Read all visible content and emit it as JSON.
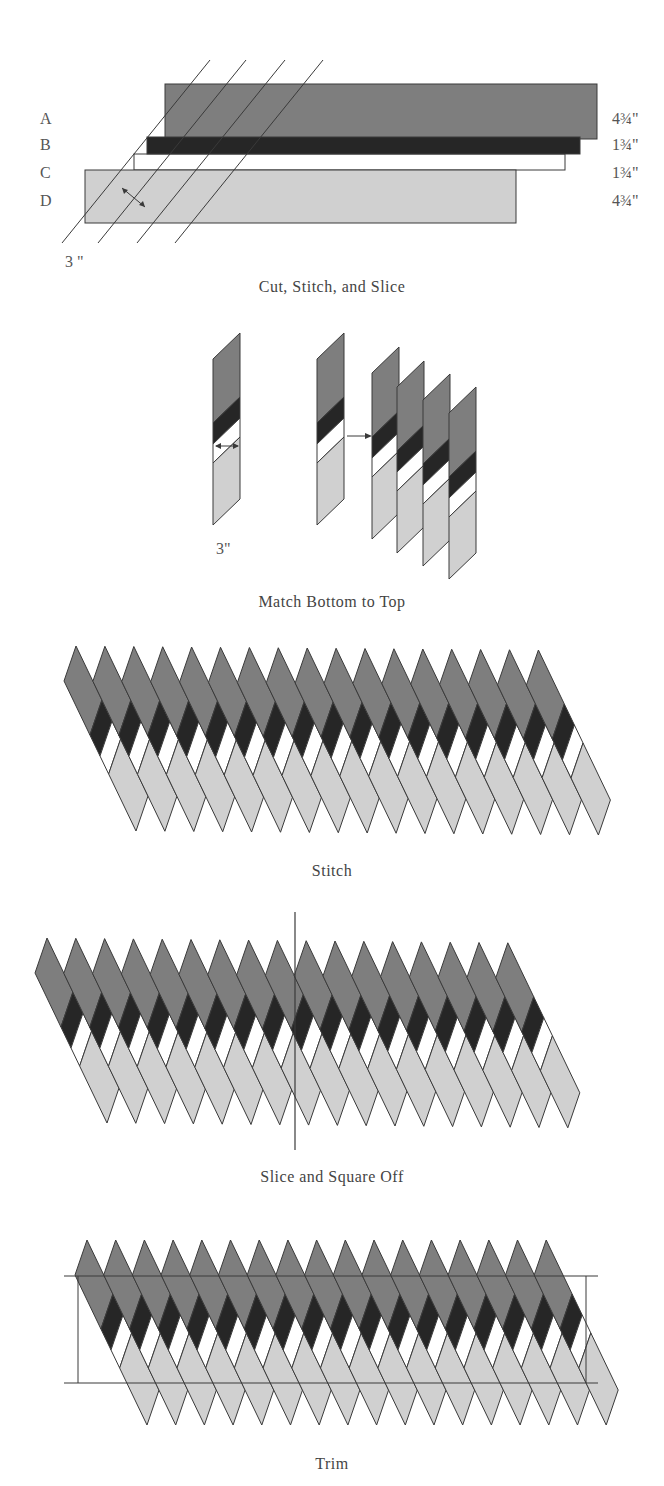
{
  "colors": {
    "dark": "#7e7e7e",
    "black": "#262626",
    "white": "#ffffff",
    "light": "#d0d0d0",
    "line": "#3a3a3a"
  },
  "step1": {
    "caption": "Cut, Stitch, and Slice",
    "strips": [
      {
        "label": "A",
        "width": "4¾\""
      },
      {
        "label": "B",
        "width": "1¾\""
      },
      {
        "label": "C",
        "width": "1¾\""
      },
      {
        "label": "D",
        "width": "4¾\""
      }
    ],
    "slice_width": "3 \""
  },
  "step2": {
    "caption": "Match Bottom to Top",
    "slice_width": "3\""
  },
  "step3": {
    "caption": "Stitch",
    "strip_count": 17
  },
  "step4": {
    "caption": "Slice and Square Off",
    "strip_count": 17
  },
  "step5": {
    "caption": "Trim",
    "strip_count": 17
  }
}
